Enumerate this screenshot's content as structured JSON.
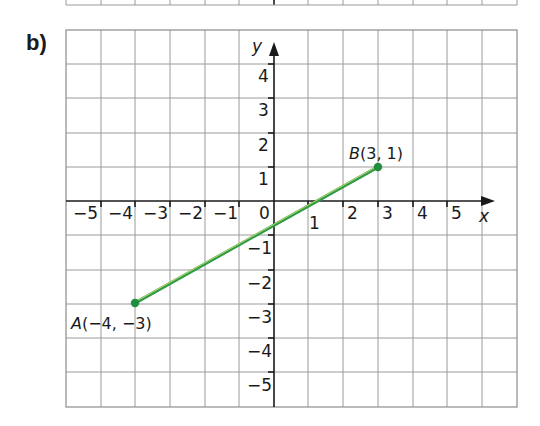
{
  "part_label": "b)",
  "axes": {
    "x_name": "x",
    "y_name": "y",
    "x_ticks": [
      {
        "value": -5,
        "label": "−5"
      },
      {
        "value": -4,
        "label": "−4"
      },
      {
        "value": -3,
        "label": "−3"
      },
      {
        "value": -2,
        "label": "−2"
      },
      {
        "value": -1,
        "label": "−1"
      },
      {
        "value": 1,
        "label": "1"
      },
      {
        "value": 2,
        "label": "2"
      },
      {
        "value": 3,
        "label": "3"
      },
      {
        "value": 4,
        "label": "4"
      },
      {
        "value": 5,
        "label": "5"
      }
    ],
    "y_ticks": [
      {
        "value": 4,
        "label": "4"
      },
      {
        "value": 3,
        "label": "3"
      },
      {
        "value": 2,
        "label": "2"
      },
      {
        "value": 1,
        "label": "1"
      },
      {
        "value": -1,
        "label": "−1"
      },
      {
        "value": -2,
        "label": "−2"
      },
      {
        "value": -3,
        "label": "−3"
      },
      {
        "value": -4,
        "label": "−4"
      },
      {
        "value": -5,
        "label": "−5"
      }
    ],
    "origin_label": "0"
  },
  "points": {
    "A": {
      "name": "A",
      "coords": "(−4, −3)",
      "x": -4,
      "y": -3
    },
    "B": {
      "name": "B",
      "coords": "(3, 1)",
      "x": 3,
      "y": 1
    }
  },
  "segment": {
    "from": "A",
    "to": "B",
    "color": "#2e9a4a",
    "highlight": "#d8e86a"
  },
  "colors": {
    "grid": "#9a9a9a",
    "axis": "#1a1a1a",
    "point": "#1f8f3f"
  }
}
